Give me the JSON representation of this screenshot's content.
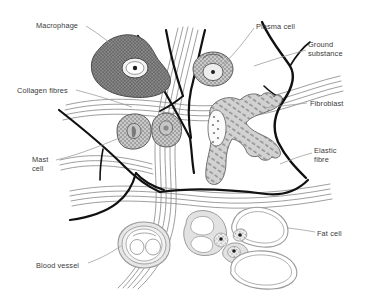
{
  "diagram": {
    "background_color": "#ffffff",
    "label_color": "#3a3a3a",
    "leader_line_color": "#9a9a9a",
    "elastic_fibre_color": "#111111",
    "collagen_fibre_color": "#8d8d8d",
    "cell_outline_color": "#6e6e6e",
    "macrophage_fill": "#7d7d7d",
    "cell_fill": "#d8d8d8",
    "fat_cell_fill": "#ffffff",
    "labels": [
      {
        "id": "macrophage",
        "text": "Macrophage",
        "x": 36,
        "y": 21,
        "align": "left"
      },
      {
        "id": "collagen-fibres",
        "text": "Collagen fibres",
        "x": 17,
        "y": 86,
        "align": "left"
      },
      {
        "id": "mast-cell",
        "text": "Mast\ncell",
        "x": 32,
        "y": 155,
        "align": "left"
      },
      {
        "id": "blood-vessel",
        "text": "Blood vessel",
        "x": 36,
        "y": 261,
        "align": "left"
      },
      {
        "id": "plasma-cell",
        "text": "Plasma cell",
        "x": 256,
        "y": 22,
        "align": "left"
      },
      {
        "id": "ground-substance",
        "text": "Ground\nsubstance",
        "x": 308,
        "y": 40,
        "align": "left"
      },
      {
        "id": "fibroblast",
        "text": "Fibroblast",
        "x": 310,
        "y": 99,
        "align": "left"
      },
      {
        "id": "elastic-fibre",
        "text": "Elastic\nfibre",
        "x": 314,
        "y": 146,
        "align": "left"
      },
      {
        "id": "fat-cell",
        "text": "Fat cell",
        "x": 317,
        "y": 229,
        "align": "left"
      }
    ],
    "structures": [
      {
        "id": "macrophage",
        "name": "Macrophage",
        "count": 1
      },
      {
        "id": "plasma-cell",
        "name": "Plasma cell",
        "count": 1
      },
      {
        "id": "mast-cell",
        "name": "Mast cell",
        "count": 2
      },
      {
        "id": "fibroblast",
        "name": "Fibroblast",
        "count": 1
      },
      {
        "id": "fat-cell",
        "name": "Fat cell",
        "count": 4
      },
      {
        "id": "blood-vessel",
        "name": "Blood vessel",
        "count": 1
      },
      {
        "id": "collagen-fibres",
        "name": "Collagen fibres",
        "count": 4
      },
      {
        "id": "elastic-fibre",
        "name": "Elastic fibre",
        "count": 3
      },
      {
        "id": "ground-substance",
        "name": "Ground substance",
        "count": 1
      }
    ]
  }
}
